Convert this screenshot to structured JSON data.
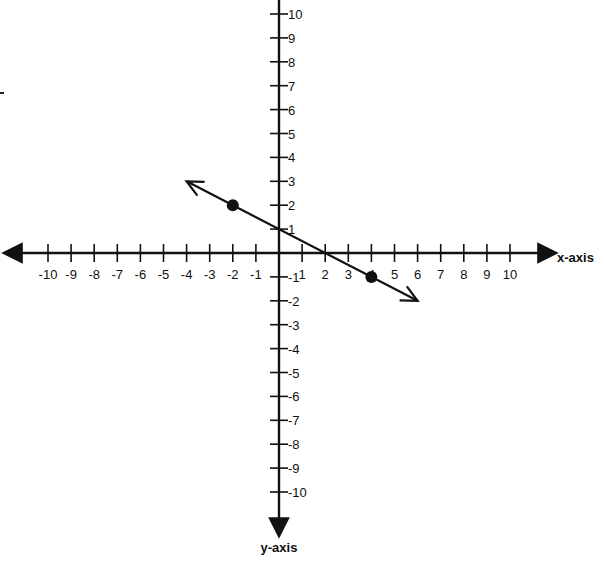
{
  "chart_data": {
    "type": "line",
    "title": "",
    "xlabel": "x-axis",
    "ylabel": "y-axis",
    "xlim": [
      -10,
      10
    ],
    "ylim": [
      -10,
      10
    ],
    "grid": false,
    "x_ticks": [
      -10,
      -9,
      -8,
      -7,
      -6,
      -5,
      -4,
      -3,
      -2,
      -1,
      1,
      2,
      3,
      4,
      5,
      6,
      7,
      8,
      9,
      10
    ],
    "y_ticks": [
      10,
      9,
      8,
      7,
      6,
      5,
      4,
      3,
      2,
      1,
      -1,
      -2,
      -3,
      -4,
      -5,
      -6,
      -7,
      -8,
      -9,
      -10
    ],
    "series": [
      {
        "name": "line",
        "equation": "y = -1/2 x + 1",
        "slope": -0.5,
        "intercept": 1,
        "extends_from": [
          -4,
          3
        ],
        "extends_to": [
          6,
          -2
        ],
        "arrows": "both",
        "points": [
          {
            "x": -2,
            "y": 2
          },
          {
            "x": 4,
            "y": -1
          }
        ]
      }
    ]
  },
  "axes": {
    "x_label": "x-axis",
    "y_label": "y-axis"
  },
  "colors": {
    "ink": "#111111",
    "background": "#ffffff"
  }
}
